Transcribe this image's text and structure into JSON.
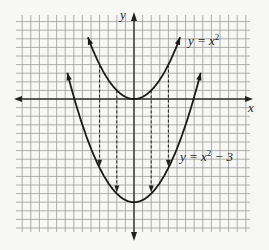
{
  "chart_data": {
    "type": "line",
    "title": "",
    "xlabel": "x",
    "ylabel": "y",
    "grid": true,
    "unit_grid_squares": 4,
    "series": [
      {
        "name": "y = x^2",
        "label": "y = x",
        "label_sup": "2",
        "vertex": [
          0,
          0
        ],
        "formula": "x^2"
      },
      {
        "name": "y = x^2 - 3",
        "label": "y = x",
        "label_sup": "2",
        "label_tail": " − 3",
        "vertex": [
          0,
          -3
        ],
        "formula": "x^2 - 3"
      }
    ],
    "vertical_shift_arrows": {
      "style": "dashed",
      "shift": -3,
      "x_positions": [
        -1,
        -0.5,
        0.5,
        1
      ]
    }
  },
  "colors": {
    "grid": "#9a9a9a",
    "curve": "#1a1a1a",
    "background": "#f7f7f5"
  }
}
